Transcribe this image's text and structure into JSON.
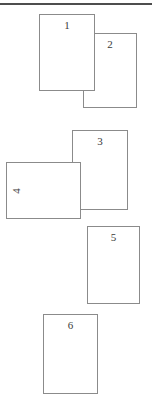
{
  "figure": {
    "top_rule": {
      "color": "#4d4d4d",
      "thickness_px": 2
    },
    "card_style": {
      "border_color": "#8b8b8b",
      "fill_color": "#ffffff",
      "number_color": "#3a3a3a"
    },
    "cards": [
      {
        "number": "1",
        "x": 39,
        "y": 14,
        "w": 56,
        "h": 77,
        "z": 2,
        "number_pos": "top",
        "number_rotation": 0
      },
      {
        "number": "2",
        "x": 83,
        "y": 33,
        "w": 54,
        "h": 75,
        "z": 1,
        "number_pos": "top",
        "number_rotation": 0
      },
      {
        "number": "3",
        "x": 72,
        "y": 130,
        "w": 56,
        "h": 80,
        "z": 1,
        "number_pos": "top",
        "number_rotation": 0
      },
      {
        "number": "4",
        "x": 6,
        "y": 162,
        "w": 75,
        "h": 57,
        "z": 2,
        "number_pos": "left",
        "number_rotation": -90
      },
      {
        "number": "5",
        "x": 87,
        "y": 226,
        "w": 53,
        "h": 78,
        "z": 1,
        "number_pos": "top",
        "number_rotation": 0
      },
      {
        "number": "6",
        "x": 43,
        "y": 314,
        "w": 55,
        "h": 80,
        "z": 1,
        "number_pos": "top",
        "number_rotation": 0
      }
    ]
  }
}
